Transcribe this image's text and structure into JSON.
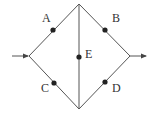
{
  "diagram": {
    "type": "network",
    "colors": {
      "line": "#555555",
      "node": "#222222",
      "label": "#333333",
      "background": "#ffffff"
    },
    "vertices": {
      "left": [
        29,
        56
      ],
      "top": [
        79,
        4
      ],
      "right": [
        130,
        56
      ],
      "bottom": [
        79,
        109
      ]
    },
    "input_arrow": {
      "from": [
        12,
        56
      ],
      "to": [
        29,
        56
      ],
      "direction": "right"
    },
    "output_arrow": {
      "from": [
        130,
        56
      ],
      "to": [
        147,
        56
      ],
      "direction": "right"
    },
    "nodes": [
      {
        "id": "A",
        "label": "A",
        "pos": [
          53,
          30
        ],
        "label_pos": [
          42,
          12
        ]
      },
      {
        "id": "B",
        "label": "B",
        "pos": [
          105,
          30
        ],
        "label_pos": [
          112,
          12
        ]
      },
      {
        "id": "C",
        "label": "C",
        "pos": [
          54,
          83
        ],
        "label_pos": [
          41,
          82
        ]
      },
      {
        "id": "D",
        "label": "D",
        "pos": [
          105,
          82
        ],
        "label_pos": [
          112,
          82
        ]
      },
      {
        "id": "E",
        "label": "E",
        "pos": [
          79,
          57
        ],
        "label_pos": [
          85,
          48
        ]
      }
    ]
  }
}
